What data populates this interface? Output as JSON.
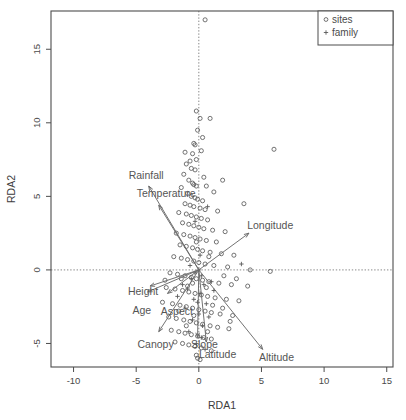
{
  "chart_data": {
    "type": "scatter",
    "title": "",
    "xlabel": "RDA1",
    "ylabel": "RDA2",
    "xlim": [
      -11.8,
      15.5
    ],
    "ylim": [
      -6.6,
      17.6
    ],
    "xticks": [
      -10,
      -5,
      0,
      5,
      10,
      15
    ],
    "yticks": [
      -5,
      0,
      5,
      10,
      15
    ],
    "grid": false,
    "reference_lines": [
      {
        "orientation": "vertical",
        "value": 0,
        "style": "dotted"
      },
      {
        "orientation": "horizontal",
        "value": 0,
        "style": "dotted"
      }
    ],
    "legend": {
      "position": "top-right",
      "entries": [
        {
          "label": "sites",
          "marker": "circle"
        },
        {
          "label": "family",
          "marker": "plus"
        }
      ]
    },
    "series": [
      {
        "name": "sites",
        "marker": "circle",
        "points": [
          [
            0.5,
            17.0
          ],
          [
            0.9,
            10.3
          ],
          [
            -0.2,
            10.8
          ],
          [
            0.1,
            10.3
          ],
          [
            -0.1,
            9.5
          ],
          [
            0.3,
            9.0
          ],
          [
            -0.4,
            8.6
          ],
          [
            -0.3,
            8.5
          ],
          [
            0.2,
            8.1
          ],
          [
            6.0,
            8.2
          ],
          [
            -0.5,
            7.9
          ],
          [
            -0.2,
            7.5
          ],
          [
            -0.7,
            7.4
          ],
          [
            -1.0,
            7.2
          ],
          [
            -0.6,
            6.9
          ],
          [
            -0.3,
            6.8
          ],
          [
            -1.2,
            6.5
          ],
          [
            -0.8,
            6.1
          ],
          [
            -0.5,
            5.9
          ],
          [
            -0.4,
            5.8
          ],
          [
            -0.2,
            5.7
          ],
          [
            0.6,
            5.7
          ],
          [
            1.9,
            6.1
          ],
          [
            1.2,
            5.3
          ],
          [
            -1.4,
            5.6
          ],
          [
            -0.9,
            5.2
          ],
          [
            -0.6,
            5.0
          ],
          [
            -0.3,
            4.9
          ],
          [
            -0.1,
            4.8
          ],
          [
            0.3,
            4.7
          ],
          [
            -1.1,
            4.5
          ],
          [
            -0.7,
            4.4
          ],
          [
            -0.4,
            4.3
          ],
          [
            0.1,
            4.2
          ],
          [
            0.5,
            4.1
          ],
          [
            1.5,
            4.0
          ],
          [
            3.6,
            4.5
          ],
          [
            -1.6,
            3.9
          ],
          [
            -1.0,
            3.8
          ],
          [
            -0.6,
            3.7
          ],
          [
            -0.2,
            3.6
          ],
          [
            0.2,
            3.5
          ],
          [
            0.7,
            3.4
          ],
          [
            -1.3,
            3.2
          ],
          [
            -0.8,
            3.1
          ],
          [
            -0.4,
            3.0
          ],
          [
            0.0,
            2.9
          ],
          [
            0.4,
            2.8
          ],
          [
            1.1,
            2.7
          ],
          [
            2.1,
            2.6
          ],
          [
            -1.8,
            2.5
          ],
          [
            -1.2,
            2.4
          ],
          [
            -0.7,
            2.3
          ],
          [
            -0.3,
            2.2
          ],
          [
            0.1,
            2.1
          ],
          [
            0.6,
            2.0
          ],
          [
            1.4,
            1.9
          ],
          [
            -1.5,
            1.7
          ],
          [
            -1.0,
            1.6
          ],
          [
            -0.5,
            1.5
          ],
          [
            -0.1,
            1.4
          ],
          [
            0.3,
            1.3
          ],
          [
            0.9,
            1.2
          ],
          [
            1.8,
            1.1
          ],
          [
            2.8,
            1.0
          ],
          [
            -2.0,
            0.9
          ],
          [
            -1.4,
            0.8
          ],
          [
            -0.9,
            0.7
          ],
          [
            -0.4,
            0.6
          ],
          [
            0.0,
            0.5
          ],
          [
            0.5,
            0.4
          ],
          [
            1.2,
            0.3
          ],
          [
            2.3,
            0.2
          ],
          [
            4.1,
            0.0
          ],
          [
            5.7,
            -0.1
          ],
          [
            -2.3,
            -0.2
          ],
          [
            -1.7,
            -0.3
          ],
          [
            -1.1,
            -0.4
          ],
          [
            -0.6,
            -0.5
          ],
          [
            -0.2,
            -0.6
          ],
          [
            0.3,
            -0.7
          ],
          [
            0.8,
            -0.8
          ],
          [
            1.6,
            -0.9
          ],
          [
            2.6,
            -1.0
          ],
          [
            3.9,
            -1.1
          ],
          [
            -2.6,
            -1.2
          ],
          [
            -1.9,
            -1.3
          ],
          [
            -1.3,
            -1.4
          ],
          [
            -0.8,
            -1.5
          ],
          [
            -0.3,
            -1.6
          ],
          [
            0.2,
            -1.7
          ],
          [
            0.7,
            -1.8
          ],
          [
            1.3,
            -1.9
          ],
          [
            2.2,
            -2.0
          ],
          [
            3.2,
            -2.1
          ],
          [
            -2.9,
            -2.2
          ],
          [
            -2.1,
            -2.3
          ],
          [
            -1.5,
            -2.4
          ],
          [
            -1.0,
            -2.5
          ],
          [
            -0.5,
            -2.6
          ],
          [
            0.0,
            -2.7
          ],
          [
            0.5,
            -2.8
          ],
          [
            1.0,
            -2.9
          ],
          [
            1.7,
            -3.0
          ],
          [
            2.7,
            -3.1
          ],
          [
            -2.4,
            -3.2
          ],
          [
            -1.8,
            -3.3
          ],
          [
            -1.2,
            -3.4
          ],
          [
            -0.7,
            -3.5
          ],
          [
            -0.2,
            -3.6
          ],
          [
            0.3,
            -3.7
          ],
          [
            0.9,
            -3.8
          ],
          [
            1.5,
            -3.9
          ],
          [
            2.4,
            -4.0
          ],
          [
            -2.2,
            -4.1
          ],
          [
            -1.6,
            -4.2
          ],
          [
            -1.1,
            -4.3
          ],
          [
            -0.6,
            -4.4
          ],
          [
            -0.1,
            -4.5
          ],
          [
            0.4,
            -4.6
          ],
          [
            1.0,
            -4.7
          ],
          [
            -1.9,
            -4.9
          ],
          [
            -1.3,
            -5.0
          ],
          [
            -0.8,
            -5.1
          ],
          [
            -0.3,
            -5.2
          ],
          [
            0.2,
            -5.3
          ],
          [
            1.0,
            -5.5
          ],
          [
            -0.2,
            -5.8
          ],
          [
            -0.1,
            -6.0
          ],
          [
            0.1,
            -6.1
          ],
          [
            -0.5,
            -0.9
          ],
          [
            -0.9,
            -1.1
          ],
          [
            -1.4,
            -0.6
          ],
          [
            0.6,
            -1.2
          ],
          [
            1.1,
            -2.4
          ],
          [
            -0.4,
            -3.1
          ],
          [
            -1.6,
            -2.8
          ],
          [
            0.8,
            0.9
          ],
          [
            -0.2,
            1.9
          ],
          [
            0.4,
            6.3
          ],
          [
            -1.1,
            8.0
          ],
          [
            2.0,
            -0.4
          ],
          [
            3.0,
            -0.6
          ],
          [
            -2.7,
            -0.7
          ],
          [
            1.9,
            -2.6
          ],
          [
            0.7,
            -4.2
          ],
          [
            -1.0,
            -3.8
          ],
          [
            2.5,
            -3.5
          ]
        ]
      },
      {
        "name": "family",
        "marker": "plus",
        "points": [
          [
            0.0,
            0.0
          ],
          [
            -0.3,
            -0.2
          ],
          [
            0.2,
            -0.4
          ],
          [
            -0.6,
            -0.6
          ],
          [
            0.4,
            -1.0
          ],
          [
            -0.9,
            -1.3
          ],
          [
            0.1,
            -1.6
          ],
          [
            -0.4,
            -2.0
          ],
          [
            0.6,
            -2.3
          ],
          [
            -1.1,
            -2.6
          ],
          [
            0.0,
            -3.0
          ],
          [
            -0.5,
            -3.4
          ],
          [
            0.3,
            -3.8
          ],
          [
            -0.8,
            -4.2
          ],
          [
            0.2,
            -4.6
          ],
          [
            -0.2,
            -5.0
          ],
          [
            0.5,
            -5.4
          ],
          [
            -1.3,
            -1.0
          ],
          [
            1.0,
            -0.8
          ],
          [
            -1.7,
            -1.8
          ],
          [
            0.8,
            -3.2
          ],
          [
            -0.1,
            -2.2
          ],
          [
            3.4,
            0.4
          ],
          [
            0.7,
            4.3
          ],
          [
            -0.3,
            3.3
          ],
          [
            0.1,
            1.0
          ],
          [
            -0.7,
            0.3
          ],
          [
            1.2,
            -1.4
          ]
        ]
      }
    ],
    "vectors": [
      {
        "label": "Rainfall",
        "x": -4.0,
        "y": 5.7,
        "label_dx": -0.2,
        "label_dy": 0.75,
        "anchor": "middle"
      },
      {
        "label": "Temperature",
        "x": -3.2,
        "y": 4.4,
        "label_dx": 0.6,
        "label_dy": 0.8,
        "anchor": "middle"
      },
      {
        "label": "Longitude",
        "x": 4.0,
        "y": 2.5,
        "label_dx": 1.7,
        "label_dy": 0.55,
        "anchor": "middle"
      },
      {
        "label": "Height",
        "x": -3.9,
        "y": -1.1,
        "label_dx": -0.55,
        "label_dy": -0.35,
        "anchor": "middle"
      },
      {
        "label": "Age",
        "x": -4.1,
        "y": -1.5,
        "label_dx": -0.45,
        "label_dy": -1.25,
        "anchor": "middle"
      },
      {
        "label": "Aspect",
        "x": -2.5,
        "y": -1.6,
        "label_dx": 0.75,
        "label_dy": -1.2,
        "anchor": "middle"
      },
      {
        "label": "Canopy",
        "x": -3.2,
        "y": -4.2,
        "label_dx": -0.25,
        "label_dy": -0.85,
        "anchor": "middle"
      },
      {
        "label": "Slope",
        "x": -0.1,
        "y": -4.6,
        "label_dx": 0.55,
        "label_dy": -0.45,
        "anchor": "middle"
      },
      {
        "label": "Latitude",
        "x": 0.6,
        "y": -4.9,
        "label_dx": 0.9,
        "label_dy": -0.85,
        "anchor": "middle"
      },
      {
        "label": "Altitude",
        "x": 5.1,
        "y": -5.4,
        "label_dx": 1.1,
        "label_dy": -0.55,
        "anchor": "middle"
      }
    ]
  }
}
